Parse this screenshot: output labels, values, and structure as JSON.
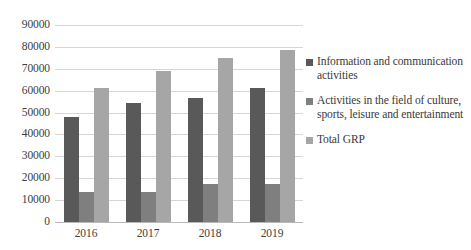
{
  "chart_data": {
    "type": "bar",
    "title": "",
    "subtitle": "",
    "xlabel": "",
    "ylabel": "",
    "categories": [
      "2016",
      "2017",
      "2018",
      "2019"
    ],
    "ylim": [
      0,
      90000
    ],
    "ytick_step": 10000,
    "yticks": [
      "90000",
      "80000",
      "70000",
      "60000",
      "50000",
      "40000",
      "30000",
      "20000",
      "10000",
      "0"
    ],
    "grid": true,
    "legend_position": "right",
    "series": [
      {
        "name": "Information and communication activities",
        "color": "#595959",
        "values": [
          48000,
          54500,
          56500,
          61000
        ]
      },
      {
        "name": "Activities in the field of culture, sports, leisure and entertainment",
        "color": "#7f7f7f",
        "values": [
          13500,
          13800,
          17500,
          17500
        ]
      },
      {
        "name": "Total GRP",
        "color": "#a6a6a6",
        "values": [
          61000,
          69000,
          75000,
          78500
        ]
      }
    ]
  },
  "legend": {
    "items": [
      {
        "label": "Information and communication activities",
        "color": "#595959"
      },
      {
        "label": "Activities in the field of culture, sports, leisure and entertainment",
        "color": "#7f7f7f"
      },
      {
        "label": "Total GRP",
        "color": "#a6a6a6"
      }
    ]
  }
}
